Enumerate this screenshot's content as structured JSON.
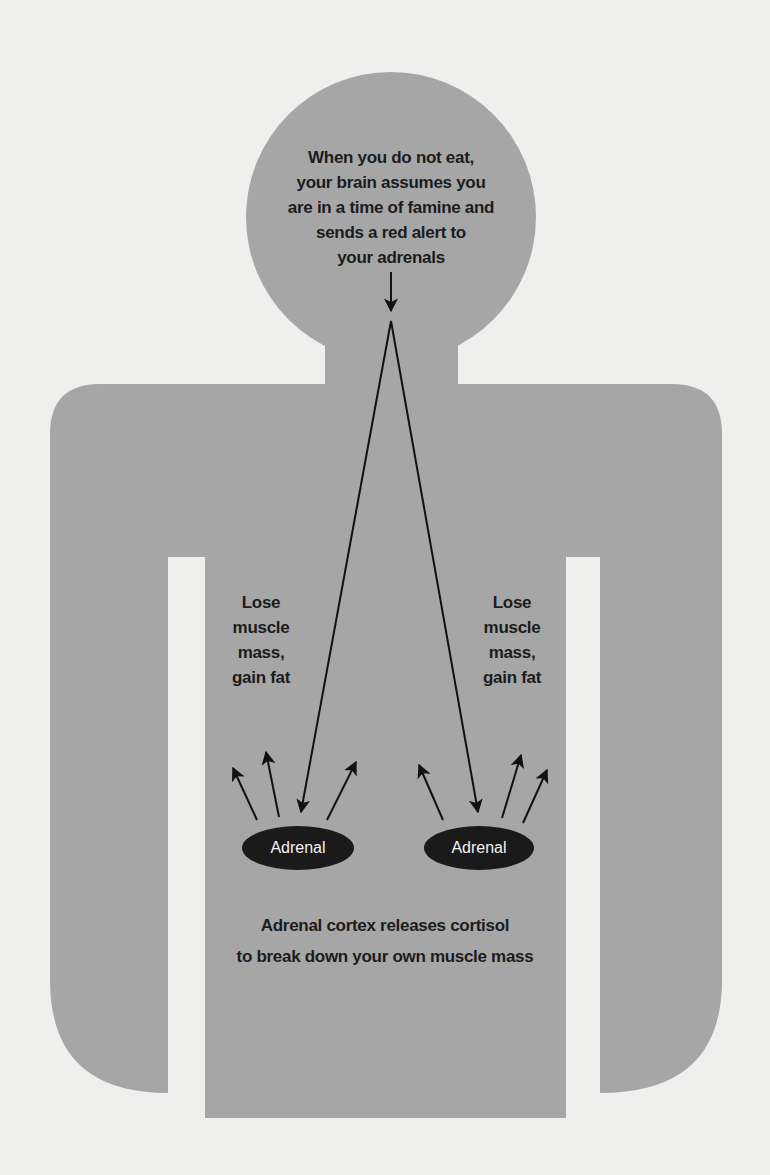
{
  "diagram": {
    "type": "body-silhouette-flow",
    "colors": {
      "background": "#efefed",
      "figure_fill": "#a6a6a6",
      "text": "#1c1c1c",
      "adrenal_fill": "#1a1a1a",
      "adrenal_text": "#f2f2f2",
      "arrow": "#111111"
    },
    "head": {
      "lines": [
        "When you do not eat,",
        "your brain assumes you",
        "are in a time of famine and",
        "sends a red alert to",
        "your adrenals"
      ]
    },
    "left_effect": {
      "lines": [
        "Lose",
        "muscle",
        "mass,",
        "gain fat"
      ]
    },
    "right_effect": {
      "lines": [
        "Lose",
        "muscle",
        "mass,",
        "gain fat"
      ]
    },
    "adrenals": [
      {
        "label": "Adrenal",
        "side": "left"
      },
      {
        "label": "Adrenal",
        "side": "right"
      }
    ],
    "caption": {
      "lines": [
        "Adrenal cortex releases cortisol",
        "to break down your own muscle mass"
      ]
    }
  }
}
